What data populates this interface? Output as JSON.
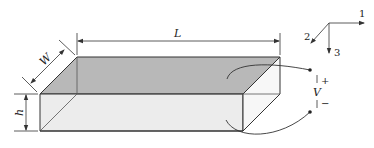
{
  "diagram": {
    "dimensions": {
      "length_label": "L",
      "width_label": "W",
      "height_label": "h"
    },
    "axes": {
      "axis1_label": "1",
      "axis2_label": "2",
      "axis3_label": "3"
    },
    "voltage": {
      "label": "V",
      "plus": "+",
      "minus": "−"
    },
    "colors": {
      "top_face": "#b8b8b8",
      "front_face": "#ececec",
      "side_face": "#f7f7f7",
      "stroke": "#333333"
    }
  }
}
